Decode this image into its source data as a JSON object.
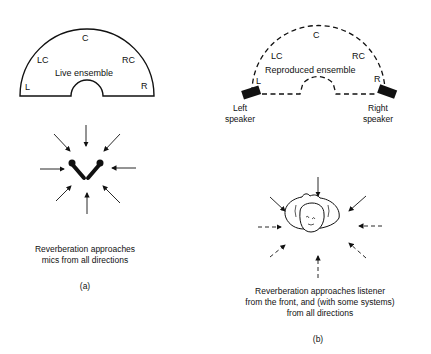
{
  "panel_a": {
    "ensemble_label": "Live ensemble",
    "positions": [
      "L",
      "LC",
      "C",
      "RC",
      "R"
    ],
    "caption_line1": "Reverberation approaches",
    "caption_line2": "mics from all directions",
    "panel_label": "(a)"
  },
  "panel_b": {
    "ensemble_label": "Reproduced ensemble",
    "positions": [
      "L",
      "LC",
      "C",
      "RC",
      "R"
    ],
    "left_speaker_line1": "Left",
    "left_speaker_line2": "speaker",
    "right_speaker_line1": "Right",
    "right_speaker_line2": "speaker",
    "caption_line1": "Reverberation approaches listener",
    "caption_line2": "from the front, and (with some systems)",
    "caption_line3": "from all directions",
    "panel_label": "(b)"
  },
  "colors": {
    "ink": "#111111",
    "background": "#ffffff"
  }
}
